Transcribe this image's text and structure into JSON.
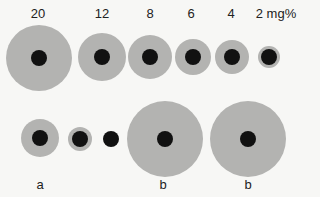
{
  "top_row": {
    "labels": [
      "20",
      "12",
      "8",
      "6",
      "4",
      "2 mg%"
    ],
    "zones": [
      {
        "cx": 39,
        "cy": 58,
        "r": 33,
        "dot_r": 8
      },
      {
        "cx": 102,
        "cy": 57,
        "r": 24,
        "dot_r": 8
      },
      {
        "cx": 150,
        "cy": 57,
        "r": 22,
        "dot_r": 8
      },
      {
        "cx": 193,
        "cy": 57,
        "r": 18,
        "dot_r": 8
      },
      {
        "cx": 232,
        "cy": 57,
        "r": 17,
        "dot_r": 8
      },
      {
        "cx": 269,
        "cy": 57,
        "r": 11,
        "dot_r": 8
      }
    ]
  },
  "bottom_row": {
    "labels": [
      "a",
      "b",
      "b"
    ],
    "zones": [
      {
        "cx": 40,
        "cy": 138,
        "r": 19,
        "dot_r": 8
      },
      {
        "cx": 80,
        "cy": 139,
        "r": 12,
        "dot_r": 8
      },
      {
        "cx": 111,
        "cy": 139,
        "r": 0,
        "dot_r": 8
      },
      {
        "cx": 165,
        "cy": 139,
        "r": 38,
        "dot_r": 8
      },
      {
        "cx": 248,
        "cy": 139,
        "r": 38,
        "dot_r": 8
      }
    ]
  }
}
